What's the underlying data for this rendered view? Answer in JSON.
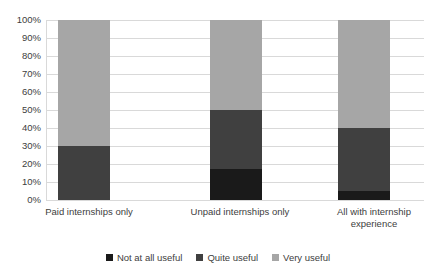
{
  "chart_data": {
    "type": "bar",
    "subtype": "stacked-100-percent",
    "title": "",
    "subtitle": "",
    "xlabel": "",
    "ylabel": "",
    "ylim": [
      0,
      100
    ],
    "grid": true,
    "legend_position": "bottom",
    "categories": [
      "Paid internships only",
      "Unpaid internships only",
      "All with internship experience"
    ],
    "category_label_lines": [
      [
        "Paid internships only"
      ],
      [
        "Unpaid internships only"
      ],
      [
        "All with internship",
        "experience"
      ]
    ],
    "ytick_labels": [
      "100%",
      "90%",
      "80%",
      "70%",
      "60%",
      "50%",
      "40%",
      "30%",
      "20%",
      "10%",
      "0%"
    ],
    "ytick_values": [
      100,
      90,
      80,
      70,
      60,
      50,
      40,
      30,
      20,
      10,
      0
    ],
    "series": [
      {
        "name": "Not at all useful",
        "color": "#1a1a1a",
        "values": [
          0,
          17,
          5
        ]
      },
      {
        "name": "Quite useful",
        "color": "#404040",
        "values": [
          30,
          33,
          35
        ]
      },
      {
        "name": "Very useful",
        "color": "#a6a6a6",
        "values": [
          70,
          50,
          60
        ]
      }
    ]
  },
  "axis": {
    "y": {
      "ticks": [
        {
          "label": "100%",
          "value": 100
        },
        {
          "label": "90%",
          "value": 90
        },
        {
          "label": "80%",
          "value": 80
        },
        {
          "label": "70%",
          "value": 70
        },
        {
          "label": "60%",
          "value": 60
        },
        {
          "label": "50%",
          "value": 50
        },
        {
          "label": "40%",
          "value": 40
        },
        {
          "label": "30%",
          "value": 30
        },
        {
          "label": "20%",
          "value": 20
        },
        {
          "label": "10%",
          "value": 10
        },
        {
          "label": "0%",
          "value": 0
        }
      ]
    },
    "x": {
      "labels": [
        "Paid internships only",
        "Unpaid internships only",
        "All with internship\nexperience"
      ]
    }
  },
  "legend": {
    "items": [
      {
        "label": "Not at all useful",
        "color": "#1a1a1a"
      },
      {
        "label": "Quite useful",
        "color": "#404040"
      },
      {
        "label": "Very useful",
        "color": "#a6a6a6"
      }
    ]
  },
  "colors": {
    "not_at_all_useful": "#1a1a1a",
    "quite_useful": "#404040",
    "very_useful": "#a6a6a6",
    "gridline": "#d9d9d9",
    "text": "#404040",
    "background": "#ffffff"
  }
}
